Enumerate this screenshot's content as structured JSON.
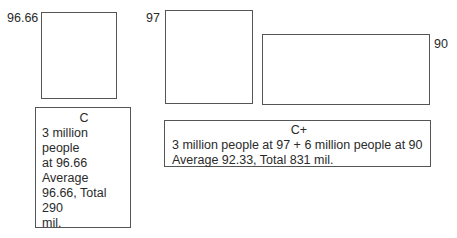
{
  "diagram": {
    "left_group": {
      "value_label": "96.66",
      "description": {
        "title": "C",
        "lines": [
          "3 million people",
          "at 96.66",
          "Average",
          "96.66, Total 290",
          "mil."
        ]
      }
    },
    "right_group": {
      "tall_box_label": "97",
      "wide_box_label": "90",
      "description": {
        "title": "C+",
        "lines": [
          "3 million people at 97 + 6 million people at 90",
          "Average 92.33, Total 831 mil."
        ]
      }
    }
  }
}
